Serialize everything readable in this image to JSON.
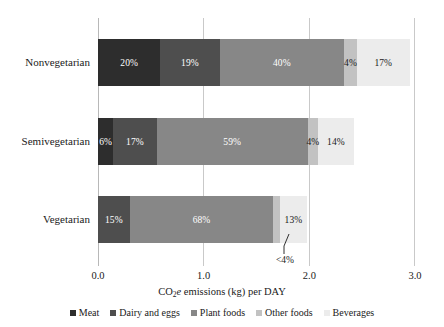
{
  "chart_data": {
    "type": "bar",
    "orientation": "horizontal",
    "stacked": true,
    "stack_mode": "absolute",
    "title": "",
    "xlabel": "CO2e emissions (kg) per DAY",
    "xlabel_parts": {
      "pre": "CO",
      "sub": "2",
      "italic": "e",
      "post": " emissions (kg) per DAY"
    },
    "ylabel": "",
    "xlim": [
      0.0,
      3.0
    ],
    "xticks": [
      0.0,
      1.0,
      2.0,
      3.0
    ],
    "xtick_labels": [
      "0.0",
      "1.0",
      "2.0",
      "3.0"
    ],
    "grid": "vertical",
    "legend_position": "bottom",
    "categories": [
      "Nonvegetarian",
      "Semivegetarian",
      "Vegetarian"
    ],
    "series": [
      {
        "name": "Meat",
        "color": "#2d2d2d",
        "values": [
          0.59,
          0.145,
          0.0
        ],
        "percent_labels": [
          "20%",
          "6%",
          ""
        ]
      },
      {
        "name": "Dairy and eggs",
        "color": "#4e4e4e",
        "values": [
          0.56,
          0.41,
          0.3
        ],
        "percent_labels": [
          "19%",
          "17%",
          "15%"
        ]
      },
      {
        "name": "Plant foods",
        "color": "#878787",
        "values": [
          1.18,
          1.43,
          1.36
        ],
        "percent_labels": [
          "40%",
          "59%",
          "68%"
        ]
      },
      {
        "name": "Other foods",
        "color": "#c2c2c2",
        "values": [
          0.12,
          0.097,
          0.06
        ],
        "percent_labels": [
          "4%",
          "4%",
          "<4%"
        ]
      },
      {
        "name": "Beverages",
        "color": "#ececec",
        "values": [
          0.5,
          0.34,
          0.26
        ],
        "percent_labels": [
          "17%",
          "14%",
          "13%"
        ]
      }
    ],
    "totals": [
      2.95,
      2.42,
      1.98
    ],
    "annotations": [
      {
        "text": "<4%",
        "series": "Other foods",
        "category": "Vegetarian",
        "style": "leader-line-below"
      }
    ]
  },
  "legend": {
    "items": [
      {
        "label": "Meat",
        "color": "#2d2d2d"
      },
      {
        "label": "Dairy and eggs",
        "color": "#4e4e4e"
      },
      {
        "label": "Plant foods",
        "color": "#878787"
      },
      {
        "label": "Other foods",
        "color": "#c2c2c2"
      },
      {
        "label": "Beverages",
        "color": "#ececec"
      }
    ]
  },
  "axis": {
    "ticks": [
      {
        "label": "0.0",
        "value": 0.0
      },
      {
        "label": "1.0",
        "value": 1.0
      },
      {
        "label": "2.0",
        "value": 2.0
      },
      {
        "label": "3.0",
        "value": 3.0
      }
    ]
  },
  "callout": {
    "text": "<4%"
  }
}
